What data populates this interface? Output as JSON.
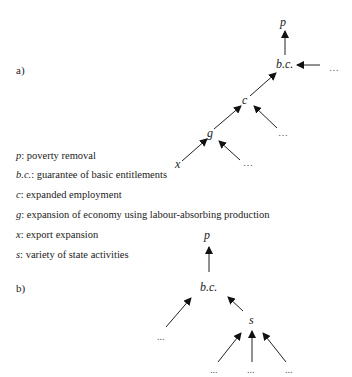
{
  "diagram_a": {
    "label": "a)",
    "nodes": {
      "p": "p",
      "bc": "b.c.",
      "c": "c",
      "g": "g",
      "x": "x",
      "ellipsis": "…"
    },
    "edges": [
      {
        "from": "b.c.",
        "to": "p"
      },
      {
        "from": "…",
        "to": "b.c."
      },
      {
        "from": "c",
        "to": "b.c."
      },
      {
        "from": "…",
        "to": "c"
      },
      {
        "from": "g",
        "to": "c"
      },
      {
        "from": "x",
        "to": "g"
      },
      {
        "from": "…",
        "to": "g"
      }
    ]
  },
  "legend": [
    {
      "key": "p",
      "text": ": poverty removal"
    },
    {
      "key": "b.c.",
      "text": ": guarantee of basic entitlements"
    },
    {
      "key": "c",
      "text": ": expanded employment"
    },
    {
      "key": "g",
      "text": ": expansion of economy using labour-absorbing production"
    },
    {
      "key": "x",
      "text": ": export expansion"
    },
    {
      "key": "s",
      "text": ": variety of state activities"
    }
  ],
  "diagram_b": {
    "label": "b)",
    "nodes": {
      "p": "p",
      "bc": "b.c.",
      "s": "s",
      "ellipsis": "..."
    },
    "edges": [
      {
        "from": "b.c.",
        "to": "p"
      },
      {
        "from": "...",
        "to": "b.c."
      },
      {
        "from": "s",
        "to": "b.c."
      },
      {
        "from": "...",
        "to": "s"
      },
      {
        "from": "...",
        "to": "s"
      },
      {
        "from": "...",
        "to": "s"
      }
    ]
  }
}
